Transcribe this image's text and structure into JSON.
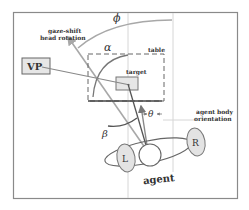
{
  "diagram": {
    "labels": {
      "gaze_shift_line1": "gaze-shift",
      "gaze_shift_line2": "head rotation",
      "phi": "ϕ",
      "alpha": "α",
      "beta": "β",
      "theta": "θ",
      "table": "table",
      "target": "target",
      "vp": "VP",
      "agent_body_line1": "agent body",
      "agent_body_line2": "orientation",
      "left": "L",
      "right": "R",
      "agent": "agent"
    },
    "colors": {
      "frame": "#8a8a8a",
      "guide": "#d6d6d6",
      "arc": "#a8a8a8",
      "line_dark": "#555555",
      "box_fill": "#e6e6e6",
      "ink": "#333333"
    }
  }
}
